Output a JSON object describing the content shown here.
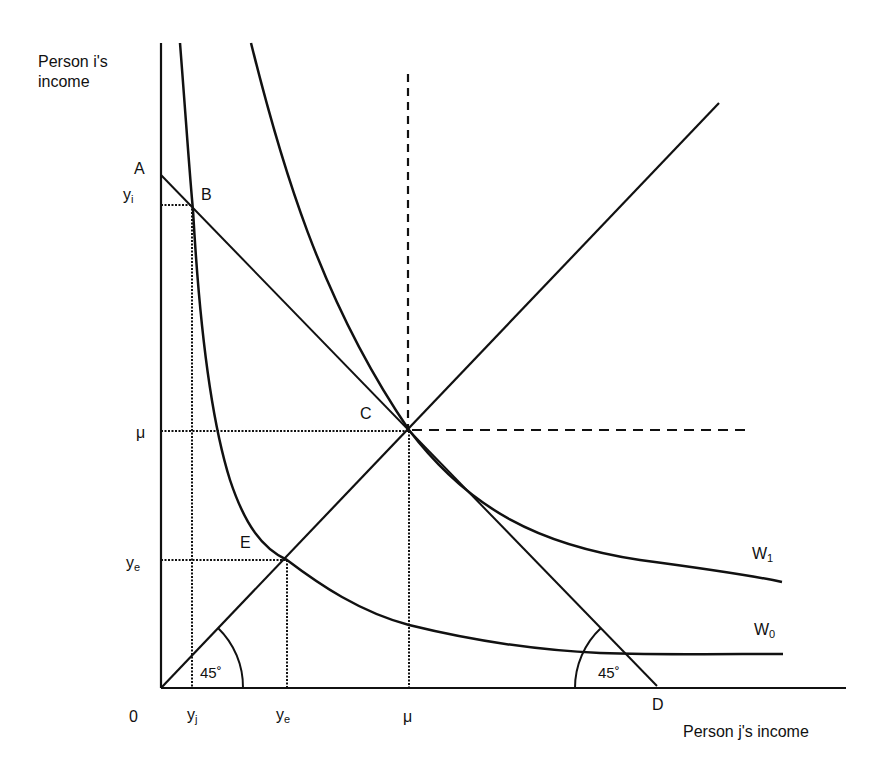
{
  "diagram": {
    "y_axis_title_line1": "Person i's",
    "y_axis_title_line2": "income",
    "x_axis_title": "Person j's income",
    "origin_label": "0",
    "points": {
      "A": "A",
      "B": "B",
      "C": "C",
      "D": "D",
      "E": "E"
    },
    "y_ticks": {
      "yi_base": "y",
      "yi_sub": "i",
      "mu": "μ",
      "ye_base": "y",
      "ye_sub": "e"
    },
    "x_ticks": {
      "yj_base": "y",
      "yj_sub": "j",
      "ye_base": "y",
      "ye_sub": "e",
      "mu": "μ"
    },
    "curves": {
      "W1_base": "W",
      "W1_sub": "1",
      "W0_base": "W",
      "W0_sub": "0"
    },
    "angles": {
      "left": "45˚",
      "right": "45˚"
    },
    "colors": {
      "line": "#111111",
      "background": "#ffffff"
    }
  }
}
